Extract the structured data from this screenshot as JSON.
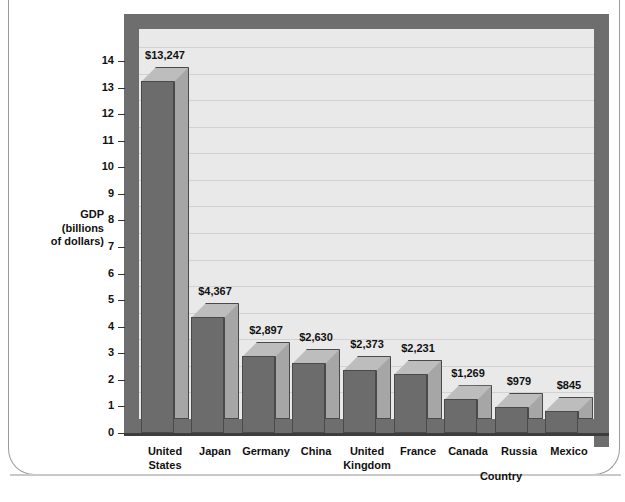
{
  "chart_data": {
    "type": "bar",
    "title": "",
    "xlabel": "Country",
    "ylabel": "GDP\n(billions\nof dollars)",
    "ylabel_lines": [
      "GDP",
      "(billions",
      "of dollars)"
    ],
    "categories": [
      "United States",
      "Japan",
      "Germany",
      "China",
      "United Kingdom",
      "France",
      "Canada",
      "Russia",
      "Mexico"
    ],
    "category_lines": [
      [
        "United",
        "States"
      ],
      [
        "Japan",
        ""
      ],
      [
        "Germany",
        ""
      ],
      [
        "China",
        ""
      ],
      [
        "United",
        "Kingdom"
      ],
      [
        "France",
        ""
      ],
      [
        "Canada",
        ""
      ],
      [
        "Russia",
        ""
      ],
      [
        "Mexico",
        ""
      ]
    ],
    "values": [
      13247,
      4367,
      2897,
      2630,
      2373,
      2231,
      1269,
      979,
      845
    ],
    "value_labels": [
      "$13,247",
      "$4,367",
      "$2,897",
      "$2,630",
      "$2,373",
      "$2,231",
      "$1,269",
      "$979",
      "$845"
    ],
    "value_unit": "billions of dollars",
    "plot_values_billions": [
      13.247,
      4.367,
      2.897,
      2.63,
      2.373,
      2.231,
      1.269,
      0.979,
      0.845
    ],
    "ylim": [
      0,
      14
    ],
    "yticks": [
      0,
      1,
      2,
      3,
      4,
      5,
      6,
      7,
      8,
      9,
      10,
      11,
      12,
      13,
      14
    ],
    "ytick_labels": [
      "0",
      "1",
      "2",
      "3",
      "4",
      "5",
      "6",
      "7",
      "8",
      "9",
      "10",
      "11",
      "12",
      "13",
      "14"
    ],
    "grid": true,
    "legend": null,
    "style": "3d-column",
    "colors": {
      "bar_front": "#6c6c6c",
      "bar_side": "#a6a6a6",
      "bar_top": "#bdbdbd",
      "bar_edge": "#4a4a4a",
      "plot_background": "#e9e9e9",
      "wall": "#6e6e6e",
      "gridline": "#d2d2d2",
      "text": "#111111",
      "page_border": "#9a9a9a"
    }
  },
  "top_sliver_text": ""
}
